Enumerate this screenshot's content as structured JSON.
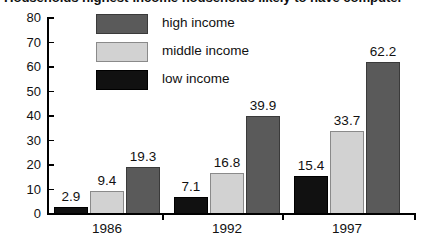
{
  "chart_data": {
    "type": "bar",
    "title": "Households highest-income households likely to have computer",
    "xlabel": "",
    "ylabel": "",
    "categories": [
      "1986",
      "1992",
      "1997"
    ],
    "series": [
      {
        "name": "low income",
        "color": "#111111",
        "values": [
          2.9,
          7.1,
          15.4
        ]
      },
      {
        "name": "middle income",
        "color": "#d2d2d2",
        "values": [
          9.4,
          16.8,
          33.7
        ]
      },
      {
        "name": "high income",
        "color": "#5a5a5a",
        "values": [
          19.3,
          39.9,
          62.2
        ]
      }
    ],
    "value_labels": [
      [
        "2.9",
        "9.4",
        "19.3"
      ],
      [
        "7.1",
        "16.8",
        "39.9"
      ],
      [
        "15.4",
        "33.7",
        "62.2"
      ]
    ],
    "ylim": [
      0,
      80
    ],
    "yticks": [
      0,
      10,
      20,
      30,
      40,
      50,
      60,
      70,
      80
    ],
    "ytick_labels": [
      "0",
      "10",
      "20",
      "30",
      "40",
      "50",
      "60",
      "70",
      "80"
    ],
    "grid": false,
    "legend_position": "top-left",
    "legend_order": [
      "high income",
      "middle income",
      "low income"
    ]
  }
}
